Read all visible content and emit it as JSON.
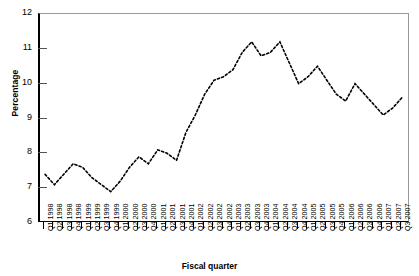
{
  "chart_data": {
    "type": "line",
    "title": "",
    "xlabel": "Fiscal quarter",
    "ylabel": "Percentage",
    "ylim": [
      6,
      12
    ],
    "yticks": [
      6,
      7,
      8,
      9,
      10,
      11,
      12
    ],
    "grid": false,
    "legend": "none",
    "line_style": "dotted",
    "line_color": "#000000",
    "categories": [
      "Q1 1998",
      "Q2 1998",
      "Q3 1998",
      "Q4 1998",
      "Q1 1999",
      "Q2 1999",
      "Q3 1999",
      "Q4 1999",
      "Q1 2000",
      "Q2 2000",
      "Q3 2000",
      "Q4 2000",
      "Q1 2001",
      "Q2 2001",
      "Q3 2001",
      "Q4 2001",
      "Q1 2002",
      "Q2 2002",
      "Q3 2002",
      "Q4 2002",
      "Q1 2003",
      "Q2 2003",
      "Q3 2003",
      "Q4 2003",
      "Q1 2004",
      "Q2 2004",
      "Q3 2004",
      "Q4 2004",
      "Q1 2005",
      "Q2 2005",
      "Q3 2005",
      "Q4 2005",
      "Q1 2006",
      "Q2 2006",
      "Q3 2006",
      "Q4 2006",
      "Q1 2007",
      "Q2 2007",
      "Q3 2007"
    ],
    "values": [
      7.4,
      7.1,
      7.4,
      7.7,
      7.6,
      7.3,
      7.1,
      6.9,
      7.2,
      7.6,
      7.9,
      7.7,
      8.1,
      8.0,
      7.8,
      8.6,
      9.1,
      9.7,
      10.1,
      10.2,
      10.4,
      10.9,
      11.2,
      10.8,
      10.9,
      11.2,
      10.6,
      10.0,
      10.2,
      10.5,
      10.1,
      9.7,
      9.5,
      10.0,
      9.7,
      9.4,
      9.1,
      9.3,
      9.6
    ]
  },
  "axes": {
    "y_title": "Percentage",
    "x_title": "Fiscal quarter"
  }
}
